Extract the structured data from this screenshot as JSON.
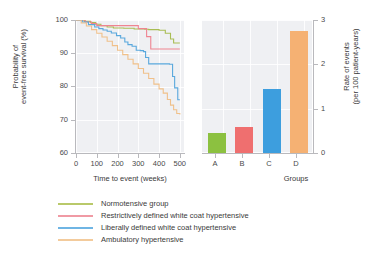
{
  "figure": {
    "background": "#ffffff",
    "panel_background": "#eff0f3",
    "axis_color": "#b9b9bd"
  },
  "chart_data": [
    {
      "type": "line",
      "id": "kaplan-meier",
      "title": "",
      "xlabel": "Time to event (weeks)",
      "ylabel": "Probability of event-free survival (%)",
      "xlim": [
        0,
        520
      ],
      "ylim": [
        60,
        100
      ],
      "xticks": [
        0,
        100,
        200,
        300,
        400,
        500
      ],
      "yticks": [
        60,
        70,
        80,
        90,
        100
      ],
      "grid": true,
      "legend_position": "below",
      "step": true,
      "series": [
        {
          "name": "Normotensive group",
          "color": "#a9bd54",
          "x": [
            0,
            40,
            70,
            95,
            120,
            150,
            180,
            230,
            280,
            330,
            350,
            400,
            430,
            455,
            470,
            500
          ],
          "y": [
            100,
            99.6,
            99.2,
            98.7,
            98.3,
            97.9,
            97.6,
            97.5,
            97.3,
            97.2,
            97.1,
            96.9,
            96.0,
            94.3,
            93.1,
            93.1
          ]
        },
        {
          "name": "Restrictively defined white coat hypertensive",
          "color": "#ef8490",
          "x": [
            0,
            45,
            75,
            100,
            140,
            180,
            230,
            280,
            300,
            320,
            340,
            360,
            420,
            470,
            500
          ],
          "y": [
            100,
            99.4,
            98.9,
            98.3,
            98.3,
            98.3,
            98.3,
            98.3,
            97.4,
            97.4,
            95.0,
            91.3,
            91.3,
            91.3,
            91.3
          ]
        },
        {
          "name": "Liberally defined white coat hypertensive",
          "color": "#5aa8dd",
          "x": [
            0,
            30,
            60,
            90,
            110,
            130,
            150,
            170,
            195,
            215,
            235,
            250,
            270,
            290,
            310,
            325,
            335,
            350,
            380,
            420,
            450,
            465,
            475,
            490,
            500
          ],
          "y": [
            100,
            99.4,
            98.6,
            97.9,
            97.4,
            97.0,
            96.6,
            96.1,
            95.3,
            94.6,
            93.4,
            92.6,
            92.1,
            90.9,
            90.8,
            90.5,
            88.7,
            86.8,
            86.8,
            86.8,
            86.7,
            83.0,
            79.6,
            76.0,
            76.0
          ]
        },
        {
          "name": "Ambulatory hypertensive",
          "color": "#f0c08a",
          "x": [
            0,
            25,
            50,
            75,
            100,
            125,
            150,
            175,
            200,
            225,
            250,
            275,
            300,
            325,
            350,
            375,
            400,
            420,
            440,
            455,
            470,
            485,
            500
          ],
          "y": [
            100,
            99.1,
            98.2,
            97.1,
            96.0,
            94.9,
            93.6,
            92.3,
            90.9,
            89.6,
            88.2,
            86.8,
            85.4,
            84.0,
            82.4,
            80.7,
            79.3,
            78.0,
            76.1,
            74.4,
            73.0,
            71.9,
            71.6
          ]
        }
      ]
    },
    {
      "type": "bar",
      "id": "event-rate",
      "title": "",
      "xlabel": "Groups",
      "ylabel": "Rate of events (per 100 patient-years)",
      "categories": [
        "A",
        "B",
        "C",
        "D"
      ],
      "values": [
        0.45,
        0.58,
        1.45,
        2.75
      ],
      "colors": [
        "#8cc140",
        "#ef6f6f",
        "#3d9ede",
        "#f5b173"
      ],
      "xticks": [
        "A",
        "B",
        "C",
        "D"
      ],
      "yticks": [
        0,
        1,
        2,
        3
      ],
      "ylim": [
        0,
        3
      ],
      "grid": true
    }
  ],
  "km_panel": {
    "ylabel_line1": "Probability of",
    "ylabel_line2": "event-free survival (%)",
    "xlabel": "Time to event (weeks)",
    "yticks": [
      "100",
      "90",
      "80",
      "70",
      "60"
    ],
    "xticks": [
      "0",
      "100",
      "200",
      "300",
      "400",
      "500"
    ]
  },
  "bar_panel": {
    "ylabel_line1": "Rate of events",
    "ylabel_line2": "(per 100 patient-years)",
    "xlabel": "Groups",
    "yticks": [
      "3",
      "2",
      "1",
      "0"
    ],
    "xticks": [
      "A",
      "B",
      "C",
      "D"
    ]
  },
  "legend": {
    "items": [
      {
        "label": "Normotensive group",
        "color": "#b9c96a"
      },
      {
        "label": "Restrictively defined white coat hypertensive",
        "color": "#f09aa4"
      },
      {
        "label": "Liberally defined white coat hypertensive",
        "color": "#6fb5e4"
      },
      {
        "label": "Ambulatory hypertensive",
        "color": "#f3cb9c"
      }
    ]
  }
}
